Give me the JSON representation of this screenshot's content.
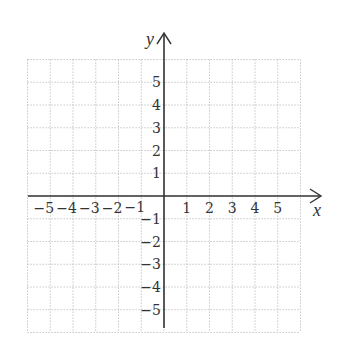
{
  "diagram": {
    "type": "coordinate-plane",
    "x_axis_label": "x",
    "y_axis_label": "y",
    "x_range": [
      -6,
      6
    ],
    "y_range": [
      -6,
      6
    ],
    "grid_step": 1,
    "grid_style": "dotted",
    "x_tick_labels": [
      "-5",
      "-4",
      "-3",
      "-2",
      "-1",
      "1",
      "2",
      "3",
      "4",
      "5"
    ],
    "y_tick_labels": [
      "5",
      "4",
      "3",
      "2",
      "1",
      "-1",
      "-2",
      "-3",
      "-4",
      "-5"
    ],
    "colors": {
      "axis": "#333333",
      "grid": "#b8b8b8",
      "background": "#ffffff"
    }
  }
}
